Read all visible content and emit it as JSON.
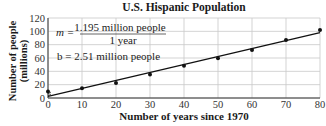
{
  "chart_data": {
    "type": "scatter",
    "title": "U.S. Hispanic Population",
    "xlabel": "Number of years since 1970",
    "ylabel": "Number of people (millions)",
    "ylabel_lines": [
      "Number of people",
      "(millions)"
    ],
    "xlim": [
      0,
      80
    ],
    "ylim": [
      0,
      120
    ],
    "x_ticks": [
      0,
      10,
      20,
      30,
      40,
      50,
      60,
      70,
      80
    ],
    "y_ticks": [
      0,
      20,
      40,
      60,
      80,
      100,
      120
    ],
    "grid": true,
    "series": [
      {
        "name": "Observed population",
        "type": "scatter",
        "x": [
          0,
          10,
          20,
          30,
          40,
          50,
          60,
          70,
          80
        ],
        "y": [
          9.6,
          14.6,
          22.4,
          35.3,
          48.4,
          59.8,
          72,
          87,
          102
        ]
      },
      {
        "name": "Linear model",
        "type": "line",
        "slope": 1.195,
        "intercept": 2.51,
        "x": [
          0,
          80
        ],
        "y": [
          2.51,
          98.11
        ]
      }
    ],
    "annotations": {
      "m_label": "m =",
      "m_numerator": "1.195 million people",
      "m_denominator": "1 year",
      "b_label": "b = 2.51 million people"
    }
  }
}
